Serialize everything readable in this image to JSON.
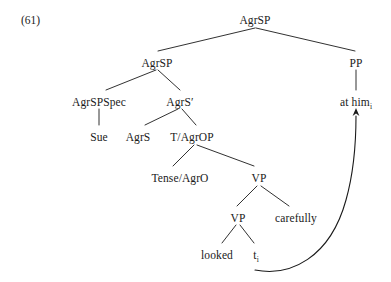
{
  "figure": {
    "example_number": "(61)",
    "background_color": "#ffffff",
    "ink_color": "#1a1a1a",
    "width": 391,
    "height": 282
  },
  "nodes": {
    "root_agrsp": {
      "label": "AgrSP",
      "x": 255,
      "y": 14
    },
    "agrsp_2": {
      "label": "AgrSP",
      "x": 157,
      "y": 57
    },
    "pp": {
      "label": "PP",
      "x": 356,
      "y": 57
    },
    "agrspspec": {
      "label": "AgrSPSpec",
      "x": 99,
      "y": 96
    },
    "agrsbar": {
      "label": "AgrS′",
      "x": 180,
      "y": 96
    },
    "at_him": {
      "label": "at him",
      "subscript": "i",
      "x": 356,
      "y": 96
    },
    "sue": {
      "label": "Sue",
      "x": 99,
      "y": 131
    },
    "agrs": {
      "label": "AgrS",
      "x": 138,
      "y": 131
    },
    "t_agrop": {
      "label": "T/AgrOP",
      "x": 192,
      "y": 131
    },
    "tense_agro": {
      "label": "Tense/AgrO",
      "x": 180,
      "y": 172
    },
    "vp_outer": {
      "label": "VP",
      "x": 259,
      "y": 172
    },
    "vp_inner": {
      "label": "VP",
      "x": 238,
      "y": 212
    },
    "carefully": {
      "label": "carefully",
      "x": 296,
      "y": 212
    },
    "looked": {
      "label": "looked",
      "x": 217,
      "y": 249
    },
    "trace": {
      "label": "t",
      "subscript": "i",
      "x": 256,
      "y": 249
    }
  },
  "edges": [
    {
      "name": "root-to-agrsp2",
      "x1": 255,
      "y1": 28,
      "x2": 158,
      "y2": 51
    },
    {
      "name": "root-to-pp",
      "x1": 256,
      "y1": 28,
      "x2": 355,
      "y2": 51
    },
    {
      "name": "agrsp2-to-spec",
      "x1": 156,
      "y1": 70,
      "x2": 106,
      "y2": 90
    },
    {
      "name": "agrsp2-to-agrsbar",
      "x1": 158,
      "y1": 70,
      "x2": 180,
      "y2": 90
    },
    {
      "name": "pp-to-at-him",
      "x1": 356,
      "y1": 70,
      "x2": 356,
      "y2": 90
    },
    {
      "name": "spec-to-sue",
      "x1": 99,
      "y1": 109,
      "x2": 99,
      "y2": 125
    },
    {
      "name": "agrsbar-to-agrs",
      "x1": 178,
      "y1": 109,
      "x2": 145,
      "y2": 125
    },
    {
      "name": "agrsbar-to-tagrop",
      "x1": 182,
      "y1": 109,
      "x2": 196,
      "y2": 125
    },
    {
      "name": "tagrop-to-tense",
      "x1": 194,
      "y1": 145,
      "x2": 173,
      "y2": 166
    },
    {
      "name": "tagrop-to-vp",
      "x1": 197,
      "y1": 145,
      "x2": 254,
      "y2": 166
    },
    {
      "name": "vpouter-to-vpinner",
      "x1": 257,
      "y1": 186,
      "x2": 237,
      "y2": 206
    },
    {
      "name": "vpouter-to-carefully",
      "x1": 261,
      "y1": 186,
      "x2": 289,
      "y2": 206
    },
    {
      "name": "vpinner-to-looked",
      "x1": 236,
      "y1": 225,
      "x2": 222,
      "y2": 243
    },
    {
      "name": "vpinner-to-trace",
      "x1": 240,
      "y1": 225,
      "x2": 254,
      "y2": 243
    }
  ],
  "movement_arrow": {
    "name": "movement-arrow-trace-to-at-him",
    "path": "M 255 270 C 290 277, 330 258, 346 200 C 355 168, 356 135, 356 116",
    "arrowhead": {
      "x": 356,
      "y": 108
    }
  }
}
